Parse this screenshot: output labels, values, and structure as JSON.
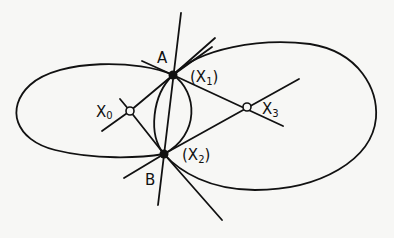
{
  "diagram": {
    "background": "#f7f7f5",
    "stroke_color": "#111111",
    "points": {
      "A": {
        "label": "A",
        "x": 173,
        "y": 75
      },
      "B": {
        "label": "B",
        "x": 164,
        "y": 154
      },
      "X0": {
        "label": "X",
        "sub": "0",
        "x": 130,
        "y": 111
      },
      "X1": {
        "label": "(X",
        "sub": "1",
        "close": ")"
      },
      "X2": {
        "label": "(X",
        "sub": "2",
        "close": ")"
      },
      "X3": {
        "label": "X",
        "sub": "3",
        "x": 247,
        "y": 107
      }
    }
  }
}
